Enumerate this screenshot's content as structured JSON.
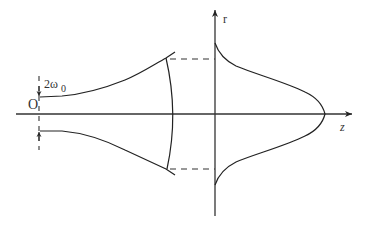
{
  "diagram": {
    "title": "",
    "labels": {
      "origin": "O",
      "waist_main": "2ω",
      "waist_sub": "0",
      "r_axis": "r",
      "z_axis": "z"
    },
    "elements": [
      {
        "id": "z-axis",
        "type": "arrow",
        "label": "z"
      },
      {
        "id": "r-axis",
        "type": "arrow",
        "label": "r"
      },
      {
        "id": "waist-marker",
        "type": "dashed-line",
        "label": "2ω0"
      },
      {
        "id": "beam-envelope-upper",
        "type": "curve"
      },
      {
        "id": "beam-envelope-lower",
        "type": "curve"
      },
      {
        "id": "wavefront",
        "type": "arc"
      },
      {
        "id": "projection-upper",
        "type": "dashed-line"
      },
      {
        "id": "projection-lower",
        "type": "dashed-line"
      },
      {
        "id": "intensity-profile",
        "type": "curve"
      }
    ],
    "colors": {
      "stroke": "#222222",
      "text": "#333333",
      "background": "#ffffff"
    }
  }
}
